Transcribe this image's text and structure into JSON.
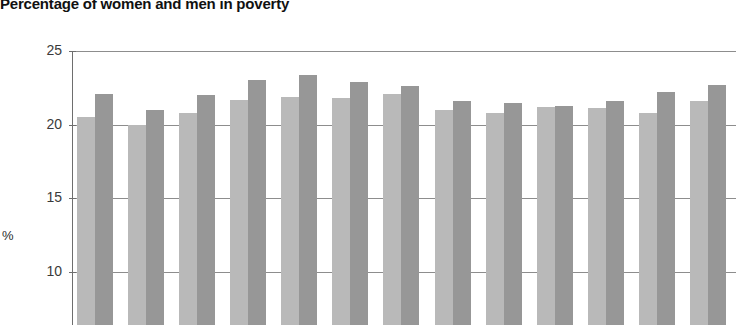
{
  "chart": {
    "title": "Percentage of women and men in poverty",
    "ylabel": "%"
  },
  "chart_data": {
    "type": "bar",
    "title": "Percentage of women and men in poverty",
    "xlabel": "",
    "ylabel": "%",
    "ylim": [
      7,
      25
    ],
    "grid": true,
    "legend_position": "none",
    "note": "Image is cropped: x-axis category labels and legend are below the visible area.",
    "yticks": [
      25,
      20,
      15,
      10
    ],
    "categories": [
      "1",
      "2",
      "3",
      "4",
      "5",
      "6",
      "7",
      "8",
      "9",
      "10",
      "11",
      "12",
      "13"
    ],
    "series": [
      {
        "name": "Women",
        "color": "#b9b9b9",
        "values": [
          20.5,
          20.0,
          20.8,
          21.7,
          21.9,
          21.8,
          22.1,
          21.0,
          20.8,
          21.2,
          21.1,
          20.8,
          21.6
        ]
      },
      {
        "name": "Men",
        "color": "#979797",
        "values": [
          22.1,
          21.0,
          22.0,
          23.0,
          23.4,
          22.9,
          22.6,
          21.6,
          21.5,
          21.3,
          21.6,
          22.2,
          22.7
        ]
      }
    ]
  }
}
